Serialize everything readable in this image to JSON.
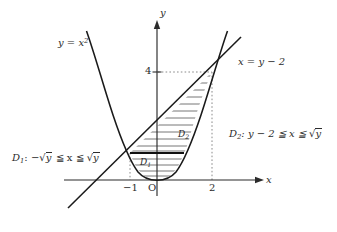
{
  "figure": {
    "type": "math-diagram",
    "background": "#ffffff",
    "ink_color": "#2b2b2b",
    "hatch_color": "#555555"
  },
  "axes": {
    "x_axis_label": "x",
    "y_axis_label": "y",
    "origin_label": "O",
    "x_ticks": [
      {
        "value": -1,
        "label": "−1"
      },
      {
        "value": 2,
        "label": "2"
      }
    ],
    "y_ticks": [
      {
        "value": 4,
        "label": "4"
      }
    ],
    "x_range": [
      -3.4,
      3.8
    ],
    "y_range": [
      -1.3,
      5.9
    ],
    "grid": false
  },
  "curves": [
    {
      "name": "parabola",
      "label": "y = x²",
      "label_text_prefix": "y = x",
      "label_exponent": "2",
      "equation": "y = x^2"
    },
    {
      "name": "line",
      "label": "x = y − 2",
      "equation": "x = y - 2"
    }
  ],
  "intersections": [
    {
      "x": -1,
      "y": 1
    },
    {
      "x": 2,
      "y": 4
    }
  ],
  "regions": [
    {
      "id": "D1",
      "inline_label_base": "D",
      "inline_label_sub": "1",
      "description_prefix": "D",
      "description_sub": "1",
      "description_body": ": −",
      "description_radicand_1": "y",
      "description_middle": " ≦ x ≦ ",
      "description_radicand_2": "y",
      "full_text": "D₁: −√y ≦ x ≦ √y"
    },
    {
      "id": "D2",
      "inline_label_base": "D",
      "inline_label_sub": "2",
      "description_prefix": "D",
      "description_sub": "2",
      "description_body": ": y − 2 ≦ x ≦ ",
      "description_radicand_1": "y",
      "full_text": "D₂: y − 2 ≦ x ≦ √y"
    }
  ],
  "guides": [
    {
      "type": "dotted-horizontal",
      "from": "y-axis",
      "to_x": 2,
      "at_y": 4
    },
    {
      "type": "dotted-vertical",
      "at_x": 2,
      "from_y": 0,
      "to_y": 4
    },
    {
      "type": "dotted-vertical",
      "at_x": -1,
      "from_y": 0,
      "to_y": 1
    }
  ],
  "hatching": {
    "style": "horizontal-lines",
    "divider_at_y": 1,
    "divider_weight": "thick"
  }
}
